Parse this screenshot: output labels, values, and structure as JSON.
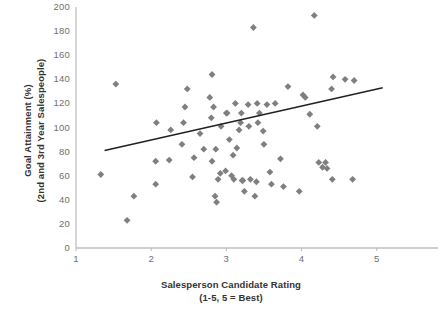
{
  "chart_data": {
    "type": "scatter",
    "title": "",
    "xlabel": "Salesperson Candidate Rating",
    "xlabel_sub": "(1-5, 5 = Best)",
    "ylabel": "Goal Attainment (%)",
    "ylabel_sub": "(2nd and 3rd Year Salespeople)",
    "xlim": [
      1,
      5.55
    ],
    "ylim": [
      0,
      200
    ],
    "xticks": [
      1,
      2,
      3,
      4,
      5
    ],
    "xtick_labels": [
      "1",
      "2",
      "3",
      "4",
      "5"
    ],
    "yticks": [
      0,
      20,
      40,
      60,
      80,
      100,
      120,
      140,
      160,
      180,
      200
    ],
    "ytick_labels": [
      "0",
      "20",
      "40",
      "60",
      "80",
      "100",
      "120",
      "140",
      "160",
      "180",
      "200"
    ],
    "grid": false,
    "legend": "none",
    "marker": "diamond",
    "marker_color": "#7f7f7f",
    "line_color": "#231f20",
    "axis_color": "#bfbfbf",
    "points": [
      [
        1.53,
        136
      ],
      [
        1.33,
        61
      ],
      [
        1.68,
        23
      ],
      [
        1.77,
        43
      ],
      [
        2.06,
        53
      ],
      [
        2.06,
        72
      ],
      [
        2.07,
        104
      ],
      [
        2.24,
        73
      ],
      [
        2.26,
        98
      ],
      [
        2.41,
        86
      ],
      [
        2.43,
        104
      ],
      [
        2.45,
        117
      ],
      [
        2.48,
        132
      ],
      [
        2.55,
        59
      ],
      [
        2.57,
        75
      ],
      [
        2.65,
        95
      ],
      [
        2.7,
        82
      ],
      [
        2.78,
        125
      ],
      [
        2.8,
        108
      ],
      [
        2.81,
        144
      ],
      [
        2.81,
        72
      ],
      [
        2.83,
        117
      ],
      [
        2.85,
        43
      ],
      [
        2.86,
        82
      ],
      [
        2.87,
        38
      ],
      [
        2.89,
        57
      ],
      [
        2.92,
        62
      ],
      [
        2.93,
        101
      ],
      [
        2.99,
        64
      ],
      [
        3.0,
        112
      ],
      [
        3.01,
        112
      ],
      [
        3.04,
        90
      ],
      [
        3.07,
        60
      ],
      [
        3.09,
        77
      ],
      [
        3.1,
        57
      ],
      [
        3.12,
        120
      ],
      [
        3.14,
        83
      ],
      [
        3.17,
        98
      ],
      [
        3.19,
        104
      ],
      [
        3.2,
        112
      ],
      [
        3.21,
        56
      ],
      [
        3.22,
        56
      ],
      [
        3.24,
        47
      ],
      [
        3.29,
        119
      ],
      [
        3.3,
        101
      ],
      [
        3.32,
        57
      ],
      [
        3.36,
        183
      ],
      [
        3.38,
        43
      ],
      [
        3.4,
        55
      ],
      [
        3.41,
        120
      ],
      [
        3.42,
        104
      ],
      [
        3.44,
        112
      ],
      [
        3.49,
        97
      ],
      [
        3.5,
        86
      ],
      [
        3.54,
        119
      ],
      [
        3.58,
        63
      ],
      [
        3.6,
        53
      ],
      [
        3.65,
        120
      ],
      [
        3.72,
        74
      ],
      [
        3.76,
        51
      ],
      [
        3.82,
        134
      ],
      [
        3.97,
        47
      ],
      [
        4.02,
        127
      ],
      [
        4.05,
        125
      ],
      [
        4.11,
        111
      ],
      [
        4.17,
        193
      ],
      [
        4.21,
        101
      ],
      [
        4.23,
        71
      ],
      [
        4.28,
        67
      ],
      [
        4.32,
        71
      ],
      [
        4.34,
        66
      ],
      [
        4.4,
        132
      ],
      [
        4.41,
        57
      ],
      [
        4.42,
        142
      ],
      [
        4.58,
        140
      ],
      [
        4.68,
        57
      ],
      [
        4.7,
        139
      ]
    ],
    "trendline": {
      "x": [
        1.38,
        5.08
      ],
      "y": [
        81,
        133
      ]
    }
  }
}
